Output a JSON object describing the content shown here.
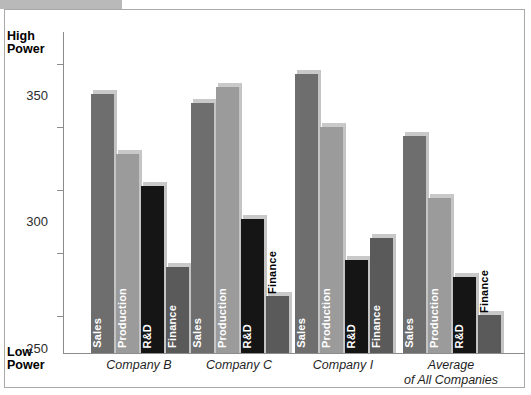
{
  "chart_data": {
    "type": "bar",
    "title": "",
    "subtitle": "",
    "xlabel": "",
    "ylabel": "",
    "grid": false,
    "legend_position": "in-bar-labels",
    "ylim": [
      120,
      375
    ],
    "yticks": [
      150,
      200,
      250,
      300,
      350
    ],
    "ytick_labels": [
      "150",
      "200",
      "250",
      "300",
      "350"
    ],
    "axis_top_label": "High\nPower",
    "axis_bottom_label": "Low\nPower",
    "categories": [
      "Company B",
      "Company C",
      "Company I",
      "Average of All Companies"
    ],
    "category_labels": [
      "Company B",
      "Company C",
      "Company I",
      "Average\nof All Companies"
    ],
    "series": [
      {
        "name": "Sales",
        "color": "#6e6e6e",
        "values": [
          325,
          318,
          341,
          292
        ]
      },
      {
        "name": "Production",
        "color": "#9b9b9b",
        "values": [
          278,
          331,
          299,
          243
        ]
      },
      {
        "name": "R&D",
        "color": "#151515",
        "values": [
          252,
          226,
          194,
          180
        ]
      },
      {
        "name": "Finance",
        "color": "#5a5a5a",
        "values": [
          188,
          165,
          211,
          150
        ]
      }
    ]
  },
  "axis": {
    "high_power_line1": "High",
    "high_power_line2": "Power",
    "low_power_line1": "Low",
    "low_power_line2": "Power",
    "tick_350": "350",
    "tick_300": "300",
    "tick_250": "250",
    "tick_200": "200",
    "tick_150": "150"
  },
  "groups": [
    {
      "caption": "Company B"
    },
    {
      "caption": "Company C"
    },
    {
      "caption": "Company I"
    },
    {
      "caption": "Average\nof All Companies"
    }
  ],
  "bar_labels": {
    "sales": "Sales",
    "production": "Production",
    "rd": "R&D",
    "finance": "Finance"
  }
}
